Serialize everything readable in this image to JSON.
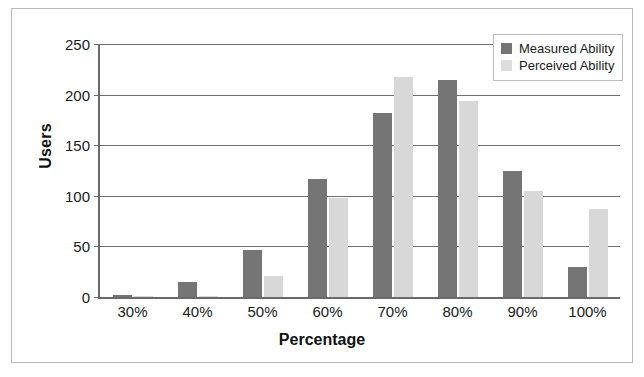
{
  "chart_data": {
    "type": "bar",
    "title": "",
    "subtitle": "",
    "xlabel": "Percentage",
    "ylabel": "Users",
    "categories": [
      "30%",
      "40%",
      "50%",
      "60%",
      "70%",
      "80%",
      "90%",
      "100%"
    ],
    "series": [
      {
        "name": "Measured Ability",
        "color": "#757575",
        "values": [
          2,
          15,
          46,
          117,
          182,
          214,
          125,
          30
        ]
      },
      {
        "name": "Perceived Ability",
        "color": "#d8d8d8",
        "values": [
          1,
          1,
          21,
          98,
          217,
          194,
          105,
          87
        ]
      }
    ],
    "ylim": [
      0,
      250
    ],
    "ytick_values": [
      0,
      50,
      100,
      150,
      200,
      250
    ],
    "ytick_labels": [
      "0",
      "50",
      "100",
      "150",
      "200",
      "250"
    ],
    "grid": "horizontal",
    "legend_position": "top-right"
  },
  "legend": {
    "items": [
      {
        "label": "Measured Ability",
        "swatch": "measured-swatch"
      },
      {
        "label": "Perceived Ability",
        "swatch": "perceived-swatch"
      }
    ]
  }
}
